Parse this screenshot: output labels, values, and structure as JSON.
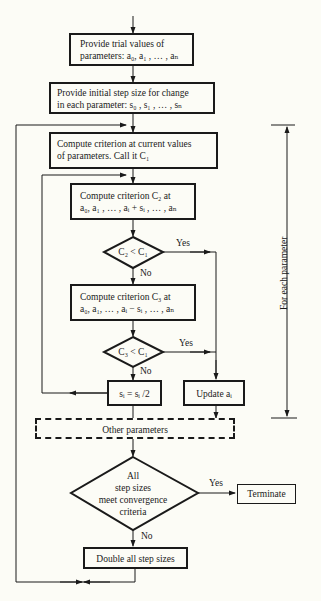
{
  "boxes": {
    "trial_values": {
      "line1": "Provide trial values of",
      "line2": "parameters: a₀, a₁ , … , aₙ"
    },
    "initial_step": {
      "line1": "Provide initial step size for change",
      "line2": "in each parameter: s₀ , s₁ , … , sₙ"
    },
    "compute_c1": {
      "line1": "Compute criterion at current values",
      "line2": "of parameters.   Call it C₁"
    },
    "compute_c2": {
      "line1": "Compute criterion  C₂  at",
      "line2": "a₀, a₁ , … , aᵢ + sᵢ , … , aₙ"
    },
    "compute_c3": {
      "line1": "Compute criterion  C₃  at",
      "line2": "a₀, a₁, … , aᵢ − sᵢ , … , aₙ"
    },
    "halve_step": "sᵢ = sᵢ /2",
    "update": "Update aᵢ",
    "other_params": "Other parameters",
    "double_steps": "Double all step sizes",
    "terminate": "Terminate"
  },
  "decisions": {
    "c2_lt_c1": "C₂ < C₁",
    "c3_lt_c1": "C₃ < C₁",
    "converged": {
      "line1": "All",
      "line2": "step sizes",
      "line3": "meet convergence",
      "line4": "criteria"
    }
  },
  "edge_labels": {
    "yes": "Yes",
    "no": "No"
  },
  "bracket_label": "For each parameter"
}
